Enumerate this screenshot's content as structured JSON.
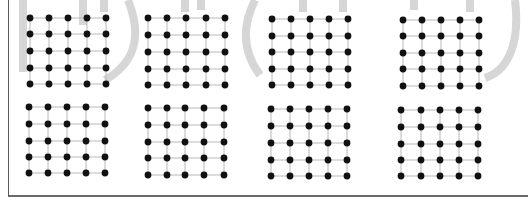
{
  "figure": {
    "rows": 2,
    "cols": 4,
    "grid_size": 5,
    "colors": {
      "node": "#111111",
      "edge": "#b8b8b8",
      "watermark": "#d4d4d4",
      "border": "#5a5a5a"
    },
    "panels": [
      {
        "id": "top-1",
        "xs": [
          30,
          49,
          68,
          87,
          106
        ],
        "ys": [
          18,
          34,
          51,
          68,
          84
        ]
      },
      {
        "id": "top-2",
        "xs": [
          148,
          167,
          186,
          206,
          225
        ],
        "ys": [
          18,
          35,
          52,
          69,
          85
        ]
      },
      {
        "id": "top-3",
        "xs": [
          272,
          291,
          310,
          329,
          348
        ],
        "ys": [
          19,
          36,
          52,
          69,
          85
        ]
      },
      {
        "id": "top-4",
        "xs": [
          403,
          422,
          441,
          460,
          479
        ],
        "ys": [
          20,
          36,
          53,
          69,
          86
        ]
      },
      {
        "id": "bottom-1",
        "xs": [
          29,
          48,
          67,
          86,
          105
        ],
        "ys": [
          107,
          124,
          141,
          157,
          173
        ]
      },
      {
        "id": "bottom-2",
        "xs": [
          148,
          167,
          185,
          204,
          224
        ],
        "ys": [
          108,
          125,
          142,
          158,
          175
        ]
      },
      {
        "id": "bottom-3",
        "xs": [
          271,
          290,
          309,
          328,
          347
        ],
        "ys": [
          109,
          126,
          143,
          160,
          176
        ]
      },
      {
        "id": "bottom-4",
        "xs": [
          401,
          421,
          440,
          459,
          478
        ],
        "ys": [
          110,
          127,
          144,
          160,
          176
        ]
      }
    ]
  }
}
